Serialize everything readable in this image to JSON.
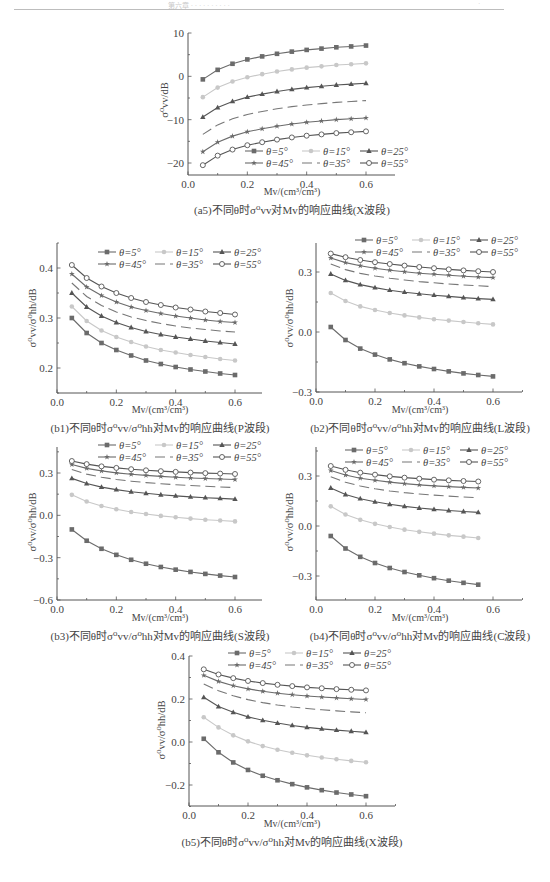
{
  "page": {
    "running_header": "第六章 ·  · · · · · · · · ·",
    "page_number": "·"
  },
  "legend": {
    "entries": [
      "θ=5°",
      "θ=15°",
      "θ=25°",
      "θ=45°",
      "θ=35°",
      "θ=55°"
    ]
  },
  "styles": {
    "theta5": {
      "color": "#6b6b6b",
      "marker": "square-filled",
      "dash": ""
    },
    "theta15": {
      "color": "#c8c8c8",
      "marker": "circle-filled-light",
      "dash": ""
    },
    "theta25": {
      "color": "#555555",
      "marker": "triangle-filled",
      "dash": ""
    },
    "theta35": {
      "color": "#777777",
      "marker": "none",
      "dash": "10,5"
    },
    "theta45": {
      "color": "#6b6b6b",
      "marker": "star-filled",
      "dash": ""
    },
    "theta55": {
      "color": "#555555",
      "marker": "circle-open",
      "dash": ""
    }
  },
  "chart_data": [
    {
      "id": "a5",
      "type": "line",
      "title": "(a5)不同θ时σ⁰vv对Mv的响应曲线(X波段)",
      "xlabel": "Mv/(cm³/cm³)",
      "ylabel": "σ⁰vv/dB",
      "xlim": [
        0,
        0.7
      ],
      "ylim": [
        -25,
        10
      ],
      "xticks": [
        "0.0",
        "0.2",
        "0.4",
        "0.6"
      ],
      "yticks": [
        "10",
        "0",
        "−10",
        "−20"
      ],
      "legend_position": "lower right",
      "x": [
        0.05,
        0.1,
        0.15,
        0.2,
        0.25,
        0.3,
        0.35,
        0.4,
        0.45,
        0.5,
        0.55,
        0.6
      ],
      "series": [
        {
          "name": "θ=5°",
          "values": [
            -0.7,
            1.5,
            2.9,
            3.9,
            4.6,
            5.2,
            5.7,
            6.1,
            6.4,
            6.7,
            6.9,
            7.1
          ]
        },
        {
          "name": "θ=15°",
          "values": [
            -4.8,
            -2.6,
            -1.2,
            -0.2,
            0.5,
            1.1,
            1.6,
            2.0,
            2.3,
            2.6,
            2.8,
            3.0
          ]
        },
        {
          "name": "θ=25°",
          "values": [
            -9.4,
            -7.2,
            -5.8,
            -4.8,
            -4.1,
            -3.5,
            -3.0,
            -2.6,
            -2.3,
            -2.0,
            -1.8,
            -1.6
          ]
        },
        {
          "name": "θ=35°",
          "values": [
            -13.4,
            -11.2,
            -9.8,
            -8.8,
            -8.1,
            -7.5,
            -7.0,
            -6.6,
            -6.3,
            -6.0,
            -5.8,
            -5.6
          ]
        },
        {
          "name": "θ=45°",
          "values": [
            -17.4,
            -15.2,
            -13.8,
            -12.8,
            -12.1,
            -11.5,
            -11.0,
            -10.6,
            -10.3,
            -10.0,
            -9.8,
            -9.6
          ]
        },
        {
          "name": "θ=55°",
          "values": [
            -20.5,
            -18.3,
            -16.9,
            -15.9,
            -15.2,
            -14.6,
            -14.1,
            -13.7,
            -13.4,
            -13.1,
            -12.9,
            -12.7
          ]
        }
      ]
    },
    {
      "id": "b1",
      "type": "line",
      "title": "(b1)不同θ时σ⁰vv/σ⁰hh对Mv的响应曲线(P波段)",
      "xlabel": "Mv/(cm³/cm³)",
      "ylabel": "σ⁰vv/σ⁰hh/dB",
      "xlim": [
        0,
        0.7
      ],
      "ylim": [
        0.15,
        0.45
      ],
      "xticks": [
        "0.0",
        "0.2",
        "0.4",
        "0.6"
      ],
      "yticks": [
        "0.4",
        "0.3",
        "0.2"
      ],
      "legend_position": "upper right",
      "x": [
        0.05,
        0.1,
        0.15,
        0.2,
        0.25,
        0.3,
        0.35,
        0.4,
        0.45,
        0.5,
        0.55,
        0.6
      ],
      "series": [
        {
          "name": "θ=5°",
          "values": [
            0.3,
            0.27,
            0.25,
            0.236,
            0.225,
            0.215,
            0.208,
            0.202,
            0.197,
            0.193,
            0.189,
            0.186
          ]
        },
        {
          "name": "θ=15°",
          "values": [
            0.323,
            0.294,
            0.275,
            0.262,
            0.252,
            0.243,
            0.236,
            0.231,
            0.226,
            0.222,
            0.218,
            0.215
          ]
        },
        {
          "name": "θ=25°",
          "values": [
            0.35,
            0.322,
            0.304,
            0.291,
            0.281,
            0.273,
            0.267,
            0.262,
            0.258,
            0.254,
            0.251,
            0.248
          ]
        },
        {
          "name": "θ=35°",
          "values": [
            0.37,
            0.343,
            0.325,
            0.312,
            0.302,
            0.295,
            0.289,
            0.284,
            0.28,
            0.277,
            0.274,
            0.272
          ]
        },
        {
          "name": "θ=45°",
          "values": [
            0.388,
            0.362,
            0.345,
            0.332,
            0.322,
            0.315,
            0.309,
            0.304,
            0.3,
            0.296,
            0.293,
            0.291
          ]
        },
        {
          "name": "θ=55°",
          "values": [
            0.406,
            0.38,
            0.363,
            0.35,
            0.34,
            0.332,
            0.326,
            0.321,
            0.317,
            0.313,
            0.31,
            0.307
          ]
        }
      ]
    },
    {
      "id": "b2",
      "type": "line",
      "title": "(b2)不同θ时σ⁰vv/σ⁰hh对Mv的响应曲线(L波段)",
      "xlabel": "Mv/(cm³/cm³)",
      "ylabel": "σ⁰vv/σ⁰hh/dB",
      "xlim": [
        0,
        0.7
      ],
      "ylim": [
        -0.3,
        0.45
      ],
      "xticks": [
        "0.0",
        "0.2",
        "0.4",
        "0.6"
      ],
      "yticks": [
        "0.3",
        "0.0",
        "−0.3"
      ],
      "legend_position": "upper right",
      "x": [
        0.05,
        0.1,
        0.15,
        0.2,
        0.25,
        0.3,
        0.35,
        0.4,
        0.45,
        0.5,
        0.55,
        0.6
      ],
      "series": [
        {
          "name": "θ=5°",
          "values": [
            0.025,
            -0.04,
            -0.083,
            -0.113,
            -0.137,
            -0.156,
            -0.172,
            -0.185,
            -0.197,
            -0.207,
            -0.215,
            -0.222
          ]
        },
        {
          "name": "θ=15°",
          "values": [
            0.195,
            0.155,
            0.128,
            0.11,
            0.095,
            0.083,
            0.073,
            0.064,
            0.057,
            0.05,
            0.044,
            0.038
          ]
        },
        {
          "name": "θ=25°",
          "values": [
            0.29,
            0.258,
            0.237,
            0.222,
            0.209,
            0.199,
            0.191,
            0.184,
            0.178,
            0.172,
            0.167,
            0.163
          ]
        },
        {
          "name": "θ=35°",
          "values": [
            0.34,
            0.312,
            0.293,
            0.28,
            0.269,
            0.26,
            0.252,
            0.246,
            0.24,
            0.235,
            0.231,
            0.227
          ]
        },
        {
          "name": "θ=45°",
          "values": [
            0.37,
            0.347,
            0.331,
            0.319,
            0.309,
            0.301,
            0.294,
            0.289,
            0.284,
            0.279,
            0.275,
            0.272
          ]
        },
        {
          "name": "θ=55°",
          "values": [
            0.392,
            0.374,
            0.36,
            0.349,
            0.34,
            0.332,
            0.325,
            0.319,
            0.313,
            0.308,
            0.304,
            0.3
          ]
        }
      ]
    },
    {
      "id": "b3",
      "type": "line",
      "title": "(b3)不同θ时σ⁰vv/σ⁰hh对Mv的响应曲线(S波段)",
      "xlabel": "Mv/(cm³/cm³)",
      "ylabel": "σ⁰vv/σ⁰hh/dB",
      "xlim": [
        0,
        0.7
      ],
      "ylim": [
        -0.6,
        0.45
      ],
      "xticks": [
        "0.0",
        "0.2",
        "0.4",
        "0.6"
      ],
      "yticks": [
        "0.3",
        "0.0",
        "−0.3",
        "−0.6"
      ],
      "legend_position": "upper right",
      "x": [
        0.05,
        0.1,
        0.15,
        0.2,
        0.25,
        0.3,
        0.35,
        0.4,
        0.45,
        0.5,
        0.55,
        0.6
      ],
      "series": [
        {
          "name": "θ=5°",
          "values": [
            -0.1,
            -0.18,
            -0.237,
            -0.28,
            -0.315,
            -0.343,
            -0.366,
            -0.385,
            -0.401,
            -0.415,
            -0.427,
            -0.437
          ]
        },
        {
          "name": "θ=15°",
          "values": [
            0.145,
            0.098,
            0.066,
            0.043,
            0.024,
            0.009,
            -0.004,
            -0.014,
            -0.023,
            -0.031,
            -0.037,
            -0.043
          ]
        },
        {
          "name": "θ=25°",
          "values": [
            0.262,
            0.225,
            0.2,
            0.182,
            0.167,
            0.156,
            0.146,
            0.138,
            0.131,
            0.125,
            0.12,
            0.115
          ]
        },
        {
          "name": "θ=35°",
          "values": [
            0.325,
            0.292,
            0.27,
            0.254,
            0.242,
            0.232,
            0.224,
            0.217,
            0.211,
            0.206,
            0.201,
            0.197
          ]
        },
        {
          "name": "θ=45°",
          "values": [
            0.36,
            0.333,
            0.315,
            0.301,
            0.291,
            0.283,
            0.276,
            0.27,
            0.265,
            0.261,
            0.257,
            0.254
          ]
        },
        {
          "name": "θ=55°",
          "values": [
            0.385,
            0.363,
            0.347,
            0.336,
            0.327,
            0.319,
            0.313,
            0.308,
            0.303,
            0.299,
            0.296,
            0.293
          ]
        }
      ]
    },
    {
      "id": "b4",
      "type": "line",
      "title": "(b4)不同θ时σ⁰vv/σ⁰hh对Mv的响应曲线(C波段)",
      "xlabel": "Mv/(cm³/cm³)",
      "ylabel": "σ⁰vv/σ⁰hh/dB",
      "xlim": [
        0,
        0.7
      ],
      "ylim": [
        -0.45,
        0.45
      ],
      "xticks": [
        "0.0",
        "0.2",
        "0.4",
        "0.6"
      ],
      "yticks": [
        "0.3",
        "0.0",
        "−0.3"
      ],
      "legend_position": "upper right",
      "x": [
        0.05,
        0.1,
        0.15,
        0.2,
        0.25,
        0.3,
        0.35,
        0.4,
        0.45,
        0.5,
        0.55
      ],
      "series": [
        {
          "name": "θ=5°",
          "values": [
            -0.06,
            -0.135,
            -0.185,
            -0.222,
            -0.252,
            -0.276,
            -0.296,
            -0.313,
            -0.328,
            -0.341,
            -0.352
          ]
        },
        {
          "name": "θ=15°",
          "values": [
            0.118,
            0.069,
            0.037,
            0.013,
            -0.006,
            -0.022,
            -0.035,
            -0.046,
            -0.056,
            -0.064,
            -0.072
          ]
        },
        {
          "name": "θ=25°",
          "values": [
            0.228,
            0.189,
            0.164,
            0.145,
            0.13,
            0.118,
            0.108,
            0.1,
            0.093,
            0.087,
            0.082
          ]
        },
        {
          "name": "θ=35°",
          "values": [
            0.295,
            0.262,
            0.24,
            0.223,
            0.21,
            0.2,
            0.192,
            0.185,
            0.179,
            0.174,
            0.169
          ]
        },
        {
          "name": "θ=45°",
          "values": [
            0.333,
            0.306,
            0.287,
            0.274,
            0.263,
            0.254,
            0.247,
            0.241,
            0.236,
            0.232,
            0.228
          ]
        },
        {
          "name": "θ=55°",
          "values": [
            0.36,
            0.337,
            0.32,
            0.308,
            0.298,
            0.29,
            0.284,
            0.278,
            0.274,
            0.27,
            0.267
          ]
        }
      ]
    },
    {
      "id": "b5",
      "type": "line",
      "title": "(b5)不同θ时σ⁰vv/σ⁰hh对Mv的响应曲线(X波段)",
      "xlabel": "Mv/(cm³/cm³)",
      "ylabel": "σ⁰vv/σ⁰hh/dB",
      "xlim": [
        0,
        0.7
      ],
      "ylim": [
        -0.3,
        0.4
      ],
      "xticks": [
        "0.0",
        "0.2",
        "0.4",
        "0.6"
      ],
      "yticks": [
        "0.4",
        "0.2",
        "0.0",
        "−0.2"
      ],
      "legend_position": "upper right",
      "x": [
        0.05,
        0.1,
        0.15,
        0.2,
        0.25,
        0.3,
        0.35,
        0.4,
        0.45,
        0.5,
        0.55,
        0.6
      ],
      "series": [
        {
          "name": "θ=5°",
          "values": [
            0.015,
            -0.048,
            -0.095,
            -0.13,
            -0.157,
            -0.178,
            -0.196,
            -0.211,
            -0.224,
            -0.235,
            -0.244,
            -0.252
          ]
        },
        {
          "name": "θ=15°",
          "values": [
            0.115,
            0.068,
            0.031,
            0.003,
            -0.019,
            -0.036,
            -0.05,
            -0.062,
            -0.072,
            -0.08,
            -0.088,
            -0.094
          ]
        },
        {
          "name": "θ=25°",
          "values": [
            0.208,
            0.165,
            0.138,
            0.117,
            0.101,
            0.088,
            0.077,
            0.068,
            0.061,
            0.055,
            0.05,
            0.045
          ]
        },
        {
          "name": "θ=35°",
          "values": [
            0.27,
            0.238,
            0.215,
            0.197,
            0.183,
            0.172,
            0.163,
            0.156,
            0.15,
            0.145,
            0.14,
            0.136
          ]
        },
        {
          "name": "θ=45°",
          "values": [
            0.31,
            0.282,
            0.262,
            0.247,
            0.236,
            0.227,
            0.22,
            0.214,
            0.209,
            0.205,
            0.201,
            0.198
          ]
        },
        {
          "name": "θ=55°",
          "values": [
            0.338,
            0.314,
            0.297,
            0.284,
            0.274,
            0.266,
            0.26,
            0.254,
            0.25,
            0.246,
            0.243,
            0.24
          ]
        }
      ]
    }
  ],
  "panels_layout": {
    "a5": {
      "left": 188,
      "top": 33,
      "x06": 366,
      "xend": 395,
      "yTopVal": 10,
      "yTopPx": 33,
      "yRefVal": -20,
      "yRefPx": 163,
      "bottom": 175,
      "axisTop": 33,
      "legendX": 245,
      "legendY": 151,
      "xlabelY": 186,
      "captionY": 201,
      "captionX": 292,
      "ylabelX": 168,
      "ylabelY": 100
    },
    "b1": {
      "left": 57,
      "x06": 235,
      "xend": 262,
      "yTopVal": 0.4,
      "yTopPx": 268,
      "yRefVal": 0.2,
      "yRefPx": 368,
      "bottom": 393,
      "axisTop": 243,
      "legendX": 98,
      "legendY": 252,
      "xlabelY": 404,
      "captionY": 419,
      "captionX": 160,
      "ylabelX": 36,
      "ylabelY": 318
    },
    "b2": {
      "left": 316,
      "x06": 493,
      "xend": 522,
      "yTopVal": 0.3,
      "yTopPx": 272,
      "yRefVal": -0.3,
      "yRefPx": 392,
      "bottom": 392,
      "axisTop": 243,
      "legendX": 355,
      "legendY": 240,
      "xlabelY": 404,
      "captionY": 419,
      "captionX": 420,
      "ylabelX": 293,
      "ylabelY": 318
    },
    "b3": {
      "left": 57,
      "x06": 235,
      "xend": 262,
      "yTopVal": 0.3,
      "yTopPx": 473,
      "yRefVal": -0.6,
      "yRefPx": 600,
      "bottom": 600,
      "axisTop": 447,
      "legendX": 98,
      "legendY": 445,
      "xlabelY": 612,
      "captionY": 627,
      "captionX": 160,
      "ylabelX": 36,
      "ylabelY": 522
    },
    "b4": {
      "left": 316,
      "x06": 493,
      "xend": 522,
      "yTopVal": 0.3,
      "yTopPx": 476,
      "yRefVal": -0.3,
      "yRefPx": 576,
      "bottom": 600,
      "axisTop": 447,
      "legendX": 345,
      "legendY": 450,
      "xlabelY": 612,
      "captionY": 627,
      "captionX": 420,
      "ylabelX": 293,
      "ylabelY": 522
    },
    "b5": {
      "left": 189,
      "x06": 366,
      "xend": 395,
      "yTopVal": 0.4,
      "yTopPx": 656,
      "yRefVal": -0.2,
      "yRefPx": 785,
      "bottom": 806,
      "axisTop": 656,
      "legendX": 228,
      "legendY": 653,
      "xlabelY": 818,
      "captionY": 833,
      "captionX": 292,
      "ylabelX": 165,
      "ylabelY": 730
    }
  }
}
